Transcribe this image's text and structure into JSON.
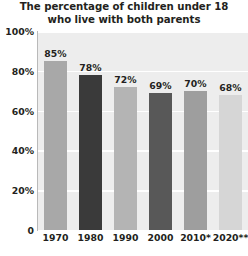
{
  "chart_data": {
    "type": "bar",
    "title": "The percentage of children under 18 who live with both parents",
    "title_line1": "The percentage of children under 18",
    "title_line2": "who live with both parents",
    "xlabel": "",
    "ylabel": "",
    "ylim": [
      0,
      100
    ],
    "grid": true,
    "legend": "none",
    "categories": [
      "1970",
      "1980",
      "1990",
      "2000",
      "2010*",
      "2020**"
    ],
    "values": [
      85,
      78,
      72,
      69,
      70,
      68
    ],
    "value_labels": [
      "85%",
      "78%",
      "72%",
      "69%",
      "70%",
      "68%"
    ],
    "ytick_labels": [
      "100%",
      "80%",
      "60%",
      "40%",
      "20%",
      "0"
    ],
    "ytick_values": [
      100,
      80,
      60,
      40,
      20,
      0
    ],
    "bar_colors": [
      "#a8a8a8",
      "#3a3a3a",
      "#b4b4b4",
      "#585858",
      "#9e9e9e",
      "#d6d6d6"
    ],
    "plot_background": "#ededed",
    "gridline_color": "#ffffff",
    "text_color": "#231f20",
    "axis_color": "#b9b9b9"
  }
}
